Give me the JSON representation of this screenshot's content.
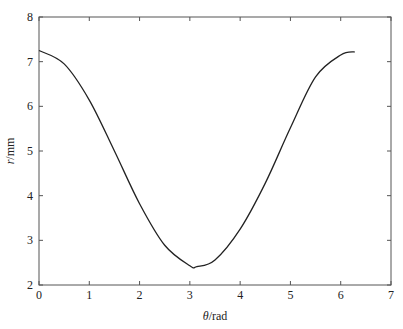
{
  "chart_data": {
    "type": "line",
    "title": "",
    "xlabel_var": "θ",
    "xlabel_unit": "/rad",
    "ylabel_var": "r",
    "ylabel_unit": "/mm",
    "xlim": [
      0,
      7
    ],
    "ylim": [
      2,
      8
    ],
    "xticks": [
      0,
      1,
      2,
      3,
      4,
      5,
      6,
      7
    ],
    "yticks": [
      2,
      3,
      4,
      5,
      6,
      7,
      8
    ],
    "grid": false,
    "legend": null,
    "series": [
      {
        "name": "r(θ)",
        "color": "#222222",
        "formula_hint": "r ≈ 4.83 + 2.42·cos(θ)",
        "x": [
          0,
          0.5,
          1.0,
          1.5,
          2.0,
          2.5,
          3.0,
          3.14,
          3.5,
          4.0,
          4.5,
          5.0,
          5.5,
          6.0,
          6.28
        ],
        "y": [
          7.25,
          6.95,
          6.14,
          5.0,
          3.82,
          2.89,
          2.43,
          2.41,
          2.56,
          3.25,
          4.28,
          5.52,
          6.66,
          7.15,
          7.22
        ]
      }
    ]
  }
}
